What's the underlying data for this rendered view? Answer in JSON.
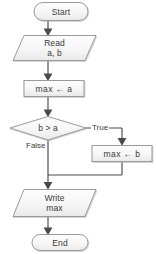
{
  "diagram": {
    "type": "flowchart",
    "colors": {
      "shape_fill_top": "#fbfbfb",
      "shape_fill_bottom": "#ececed",
      "shape_stroke": "#9a9a9a",
      "connector": "#4a4a4a",
      "text": "#3a3a3a",
      "background": "#ffffff"
    },
    "nodes": [
      {
        "id": "start",
        "shape": "terminator",
        "label": "Start",
        "lines": [
          "Start"
        ]
      },
      {
        "id": "read",
        "shape": "parallelogram",
        "label": "Read a, b",
        "lines": [
          "Read",
          "a, b"
        ]
      },
      {
        "id": "assign-max-a",
        "shape": "process",
        "label": "max ← a",
        "lines": [
          "max ←  a"
        ]
      },
      {
        "id": "decision",
        "shape": "diamond",
        "label": "b > a",
        "lines": [
          "b > a"
        ]
      },
      {
        "id": "assign-max-b",
        "shape": "process",
        "label": "max ← b",
        "lines": [
          "max ←  b"
        ]
      },
      {
        "id": "write",
        "shape": "parallelogram",
        "label": "Write max",
        "lines": [
          "Write",
          "max"
        ]
      },
      {
        "id": "end",
        "shape": "terminator",
        "label": "End",
        "lines": [
          "End"
        ]
      }
    ],
    "edge_labels": {
      "true_branch": "True",
      "false_branch": "False"
    }
  }
}
